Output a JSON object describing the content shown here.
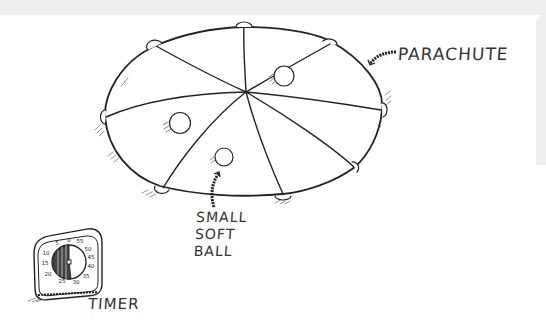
{
  "illustration": {
    "subject": "Parachute play activity sketch",
    "labels": {
      "parachute": "PARACHUTE",
      "ball": "SMALL\nSOFT\nBALL",
      "timer": "TIMER"
    },
    "parachute": {
      "panels": 8,
      "handles": 8,
      "balls_on_parachute": 3
    },
    "timer": {
      "dial_numbers": [
        "0",
        "55",
        "50",
        "45",
        "40",
        "35",
        "30",
        "25",
        "20",
        "15",
        "10",
        "5"
      ],
      "shaded_minutes": 30
    },
    "colors": {
      "ink": "#222222",
      "paper": "#ffffff",
      "frame": "#efefef"
    }
  }
}
